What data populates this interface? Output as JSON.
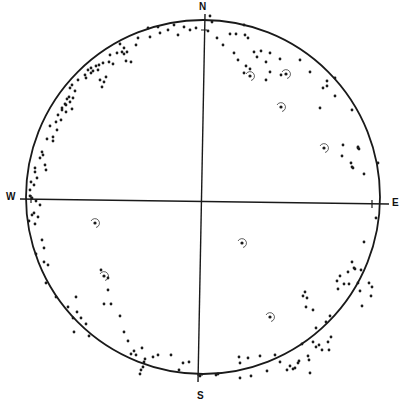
{
  "diagram": {
    "type": "stereonet-pole-plot",
    "center": [
      203,
      197
    ],
    "radius": 177,
    "colors": {
      "ink": "#1a1a1a",
      "background": "#ffffff"
    },
    "labels": {
      "north": {
        "text": "N",
        "x": 199,
        "y": 1
      },
      "south": {
        "text": "S",
        "x": 197,
        "y": 390
      },
      "west": {
        "text": "W",
        "x": 6,
        "y": 191
      },
      "east": {
        "text": "E",
        "x": 392,
        "y": 197
      }
    },
    "axes": {
      "ns": [
        [
          205,
          14
        ],
        [
          198,
          382
        ]
      ],
      "ew": [
        [
          20,
          199
        ],
        [
          389,
          204
        ]
      ]
    },
    "circled_points": [
      [
        250,
        76
      ],
      [
        286,
        74
      ],
      [
        281,
        107
      ],
      [
        324,
        148
      ],
      [
        95,
        223
      ],
      [
        242,
        243
      ],
      [
        270,
        317
      ],
      [
        104,
        276
      ]
    ],
    "points": [
      [
        148,
        28
      ],
      [
        158,
        27
      ],
      [
        168,
        30
      ],
      [
        174,
        25
      ],
      [
        184,
        27
      ],
      [
        190,
        30
      ],
      [
        196,
        28
      ],
      [
        178,
        35
      ],
      [
        160,
        33
      ],
      [
        150,
        37
      ],
      [
        138,
        38
      ],
      [
        120,
        44
      ],
      [
        124,
        48
      ],
      [
        122,
        52
      ],
      [
        127,
        52
      ],
      [
        124,
        54
      ],
      [
        117,
        53
      ],
      [
        126,
        61
      ],
      [
        131,
        62
      ],
      [
        136,
        45
      ],
      [
        110,
        55
      ],
      [
        109,
        62
      ],
      [
        113,
        64
      ],
      [
        103,
        63
      ],
      [
        99,
        65
      ],
      [
        96,
        66
      ],
      [
        98,
        70
      ],
      [
        91,
        68
      ],
      [
        88,
        70
      ],
      [
        93,
        71
      ],
      [
        86,
        78
      ],
      [
        91,
        73
      ],
      [
        100,
        80
      ],
      [
        106,
        77
      ],
      [
        85,
        75
      ],
      [
        102,
        87
      ],
      [
        104,
        82
      ],
      [
        78,
        80
      ],
      [
        72,
        85
      ],
      [
        70,
        88
      ],
      [
        75,
        91
      ],
      [
        69,
        97
      ],
      [
        70,
        102
      ],
      [
        65,
        104
      ],
      [
        62,
        108
      ],
      [
        58,
        115
      ],
      [
        61,
        120
      ],
      [
        66,
        112
      ],
      [
        66,
        105
      ],
      [
        72,
        109
      ],
      [
        73,
        98
      ],
      [
        67,
        99
      ],
      [
        62,
        110
      ],
      [
        56,
        122
      ],
      [
        50,
        126
      ],
      [
        57,
        130
      ],
      [
        53,
        137
      ],
      [
        47,
        139
      ],
      [
        53,
        141
      ],
      [
        42,
        152
      ],
      [
        43,
        155
      ],
      [
        40,
        158
      ],
      [
        45,
        165
      ],
      [
        46,
        170
      ],
      [
        35,
        168
      ],
      [
        35,
        172
      ],
      [
        37,
        178
      ],
      [
        31,
        182
      ],
      [
        34,
        185
      ],
      [
        30,
        190
      ],
      [
        30,
        196
      ],
      [
        32,
        198
      ],
      [
        36,
        201
      ],
      [
        40,
        205
      ],
      [
        34,
        213
      ],
      [
        38,
        217
      ],
      [
        32,
        215
      ],
      [
        35,
        224
      ],
      [
        29,
        221
      ],
      [
        42,
        240
      ],
      [
        44,
        248
      ],
      [
        36,
        254
      ],
      [
        48,
        265
      ],
      [
        44,
        262
      ],
      [
        46,
        283
      ],
      [
        56,
        297
      ],
      [
        68,
        307
      ],
      [
        76,
        297
      ],
      [
        77,
        312
      ],
      [
        81,
        318
      ],
      [
        86,
        324
      ],
      [
        89,
        336
      ],
      [
        73,
        318
      ],
      [
        74,
        332
      ],
      [
        101,
        270
      ],
      [
        108,
        278
      ],
      [
        108,
        290
      ],
      [
        104,
        304
      ],
      [
        111,
        304
      ],
      [
        120,
        316
      ],
      [
        124,
        332
      ],
      [
        128,
        341
      ],
      [
        131,
        354
      ],
      [
        134,
        351
      ],
      [
        136,
        355
      ],
      [
        142,
        348
      ],
      [
        143,
        367
      ],
      [
        141,
        370
      ],
      [
        140,
        374
      ],
      [
        144,
        362
      ],
      [
        145,
        359
      ],
      [
        158,
        355
      ],
      [
        153,
        357
      ],
      [
        171,
        355
      ],
      [
        179,
        370
      ],
      [
        183,
        363
      ],
      [
        189,
        362
      ],
      [
        200,
        376
      ],
      [
        210,
        16
      ],
      [
        212,
        22
      ],
      [
        208,
        31
      ],
      [
        217,
        38
      ],
      [
        223,
        45
      ],
      [
        230,
        34
      ],
      [
        236,
        34
      ],
      [
        245,
        35
      ],
      [
        244,
        25
      ],
      [
        248,
        38
      ],
      [
        254,
        52
      ],
      [
        261,
        51
      ],
      [
        257,
        57
      ],
      [
        238,
        60
      ],
      [
        234,
        53
      ],
      [
        246,
        66
      ],
      [
        250,
        69
      ],
      [
        244,
        73
      ],
      [
        266,
        62
      ],
      [
        270,
        72
      ],
      [
        270,
        53
      ],
      [
        266,
        80
      ],
      [
        280,
        59
      ],
      [
        281,
        75
      ],
      [
        300,
        60
      ],
      [
        310,
        72
      ],
      [
        327,
        81
      ],
      [
        327,
        86
      ],
      [
        320,
        108
      ],
      [
        335,
        96
      ],
      [
        335,
        78
      ],
      [
        323,
        88
      ],
      [
        352,
        110
      ],
      [
        358,
        147
      ],
      [
        358,
        148
      ],
      [
        343,
        145
      ],
      [
        342,
        156
      ],
      [
        351,
        163
      ],
      [
        352,
        167
      ],
      [
        353,
        168
      ],
      [
        364,
        174
      ],
      [
        359,
        149
      ],
      [
        378,
        163
      ],
      [
        376,
        218
      ],
      [
        364,
        242
      ],
      [
        361,
        270
      ],
      [
        352,
        262
      ],
      [
        354,
        268
      ],
      [
        355,
        269
      ],
      [
        348,
        272
      ],
      [
        340,
        276
      ],
      [
        337,
        281
      ],
      [
        349,
        284
      ],
      [
        358,
        283
      ],
      [
        344,
        284
      ],
      [
        360,
        291
      ],
      [
        338,
        289
      ],
      [
        362,
        306
      ],
      [
        369,
        283
      ],
      [
        372,
        287
      ],
      [
        371,
        296
      ],
      [
        303,
        296
      ],
      [
        305,
        292
      ],
      [
        307,
        298
      ],
      [
        306,
        307
      ],
      [
        313,
        310
      ],
      [
        326,
        322
      ],
      [
        330,
        316
      ],
      [
        316,
        328
      ],
      [
        319,
        345
      ],
      [
        328,
        342
      ],
      [
        331,
        337
      ],
      [
        329,
        350
      ],
      [
        313,
        342
      ],
      [
        302,
        344
      ],
      [
        309,
        360
      ],
      [
        308,
        356
      ],
      [
        299,
        361
      ],
      [
        293,
        369
      ],
      [
        295,
        368
      ],
      [
        290,
        366
      ],
      [
        287,
        370
      ],
      [
        280,
        362
      ],
      [
        275,
        355
      ],
      [
        298,
        363
      ],
      [
        310,
        373
      ],
      [
        267,
        371
      ],
      [
        260,
        356
      ],
      [
        239,
        357
      ],
      [
        240,
        363
      ],
      [
        248,
        358
      ],
      [
        251,
        376
      ],
      [
        216,
        375
      ],
      [
        218,
        374
      ],
      [
        240,
        378
      ],
      [
        316,
        347
      ],
      [
        322,
        350
      ]
    ],
    "tick_marks_on_ew_axis": [
      [
        31,
        199
      ],
      [
        372,
        204
      ]
    ],
    "tick_marks_on_ns_axis": [
      [
        204,
        30
      ],
      [
        200,
        375
      ]
    ]
  }
}
